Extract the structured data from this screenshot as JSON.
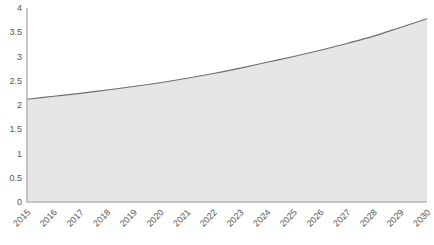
{
  "chart_data": {
    "type": "area",
    "title": "",
    "subtitle": "",
    "xlabel": "",
    "ylabel": "",
    "categories": [
      "2015",
      "2016",
      "2017",
      "2018",
      "2019",
      "2020",
      "2021",
      "2022",
      "2023",
      "2024",
      "2025",
      "2026",
      "2027",
      "2028",
      "2029",
      "2030"
    ],
    "values": [
      2.12,
      2.18,
      2.24,
      2.31,
      2.38,
      2.46,
      2.55,
      2.65,
      2.76,
      2.88,
      3.0,
      3.13,
      3.27,
      3.42,
      3.6,
      3.78
    ],
    "series": [
      {
        "name": "",
        "values": [
          2.12,
          2.18,
          2.24,
          2.31,
          2.38,
          2.46,
          2.55,
          2.65,
          2.76,
          2.88,
          3.0,
          3.13,
          3.27,
          3.42,
          3.6,
          3.78
        ]
      }
    ],
    "ylim": [
      0,
      4
    ],
    "yticks": [
      0,
      0.5,
      1,
      1.5,
      2,
      2.5,
      3,
      3.5,
      4
    ],
    "ytick_labels": [
      "0",
      "0.5",
      "1",
      "1.5",
      "2",
      "2.5",
      "3",
      "3.5",
      "4"
    ],
    "xtick_labels": [
      "2015",
      "2016",
      "2017",
      "2018",
      "2019",
      "2020",
      "2021",
      "2022",
      "2023",
      "2024",
      "2025",
      "2026",
      "2027",
      "2028",
      "2029",
      "2030"
    ],
    "grid": false,
    "legend": false,
    "legend_position": "none",
    "colors": {
      "area_fill": "#e6e6e6",
      "line": "#6d6d6d",
      "axis": "#9a9a9a",
      "tick_text": "#555555",
      "background": "#ffffff"
    }
  }
}
